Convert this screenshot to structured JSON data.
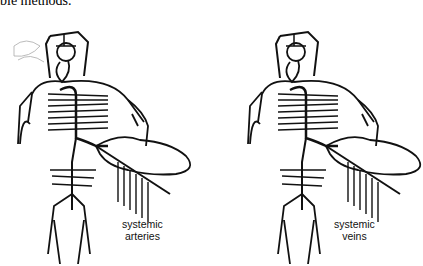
{
  "caption": "ble methods.",
  "figures": [
    {
      "id": "arteries",
      "label_line1": "systemic",
      "label_line2": "arteries"
    },
    {
      "id": "veins",
      "label_line1": "systemic",
      "label_line2": "veins"
    }
  ],
  "colors": {
    "stroke": "#111111",
    "background": "#ffffff",
    "faint": "#aaaaaa"
  }
}
